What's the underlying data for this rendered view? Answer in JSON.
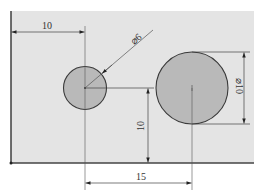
{
  "diagram": {
    "type": "engineering-drawing",
    "colors": {
      "plate": "#e4e4e4",
      "hole_fill": "#b9b9b9",
      "line": "#3a3a3a",
      "thin_line": "#555555"
    },
    "dimensions": {
      "left_offset": "10",
      "small_diameter": "⌀6",
      "large_diameter": "⌀10",
      "vertical_offset": "10",
      "center_distance": "15"
    },
    "holes": [
      {
        "name": "small-hole",
        "diameter_label": "⌀6"
      },
      {
        "name": "large-hole",
        "diameter_label": "⌀10"
      }
    ]
  }
}
